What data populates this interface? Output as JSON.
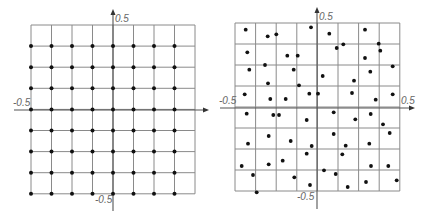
{
  "colors": {
    "grid": "#8a8a8a",
    "axis": "#555555",
    "dot": "#111111",
    "label": "#666666"
  },
  "panels": [
    {
      "name": "regular-grid-samples",
      "grid": {
        "x0": 31,
        "y0": 25,
        "cols": 8,
        "rows": 8,
        "cell_w": 20.5,
        "cell_h": 21.1
      },
      "axes": {
        "h": {
          "x1": 14,
          "x2": 209,
          "y": 110
        },
        "v": {
          "x": 113,
          "y1": 9,
          "y2": 211
        }
      },
      "labels": {
        "y_top": {
          "text": "0.5",
          "x": 115,
          "y": 22
        },
        "x_left": {
          "text": "-0.5",
          "x": 13,
          "y": 106
        },
        "y_bottom": {
          "text": "-0.5",
          "x": 95,
          "y": 203
        }
      },
      "dots_rule": {
        "cols": [
          0,
          1,
          2,
          3,
          4,
          5,
          6,
          7
        ],
        "rows": [
          1,
          2,
          3,
          4,
          5,
          6,
          7,
          8
        ]
      }
    },
    {
      "name": "jittered-random-samples",
      "grid": {
        "x0": 235,
        "y0": 23,
        "cols": 8,
        "rows": 8,
        "cell_w": 20.6,
        "cell_h": 21.0
      },
      "axes": {
        "h": {
          "x1": 220,
          "x2": 415,
          "y": 108
        },
        "v": {
          "x": 317,
          "y1": 7,
          "y2": 209
        }
      },
      "labels": {
        "y_top": {
          "text": "0.5",
          "x": 319,
          "y": 20
        },
        "x_left": {
          "text": "-0.5",
          "x": 219,
          "y": 104
        },
        "x_right": {
          "text": "0.5",
          "x": 401,
          "y": 104
        },
        "y_bottom": {
          "text": "-0.5",
          "x": 297,
          "y": 200
        }
      },
      "dots": [
        [
          245.7,
          29.7
        ],
        [
          267.7,
          36.3
        ],
        [
          276.3,
          34.3
        ],
        [
          311,
          27.3
        ],
        [
          247.3,
          52.3
        ],
        [
          287.3,
          55.7
        ],
        [
          297.7,
          55.7
        ],
        [
          265,
          65
        ],
        [
          249.3,
          69.7
        ],
        [
          293.7,
          69.7
        ],
        [
          268,
          83.3
        ],
        [
          299,
          85.3
        ],
        [
          244.7,
          94.3
        ],
        [
          270.3,
          99
        ],
        [
          285.7,
          99
        ],
        [
          309.3,
          93.7
        ],
        [
          318,
          93.7
        ],
        [
          329.3,
          33.7
        ],
        [
          365,
          29.7
        ],
        [
          336.7,
          48
        ],
        [
          343.3,
          44.3
        ],
        [
          378.7,
          43.7
        ],
        [
          380.3,
          50.7
        ],
        [
          365,
          58
        ],
        [
          392.7,
          66.3
        ],
        [
          322.7,
          76
        ],
        [
          370.3,
          71.7
        ],
        [
          354,
          80.7
        ],
        [
          352,
          93
        ],
        [
          375.7,
          99.7
        ],
        [
          392.7,
          94.3
        ],
        [
          246.7,
          113.7
        ],
        [
          273.3,
          115
        ],
        [
          279,
          115
        ],
        [
          306.7,
          120
        ],
        [
          268.7,
          136
        ],
        [
          248,
          143.7
        ],
        [
          290.7,
          141
        ],
        [
          311.7,
          146
        ],
        [
          306.7,
          153.7
        ],
        [
          282.7,
          160.7
        ],
        [
          268.7,
          164.3
        ],
        [
          241.7,
          166
        ],
        [
          253,
          175
        ],
        [
          294.3,
          177.3
        ],
        [
          310,
          185
        ],
        [
          256.7,
          192.3
        ],
        [
          333.7,
          112.3
        ],
        [
          355.3,
          119.3
        ],
        [
          370.7,
          114
        ],
        [
          383,
          124.3
        ],
        [
          333.7,
          134
        ],
        [
          389.7,
          133
        ],
        [
          345.7,
          145.7
        ],
        [
          369.3,
          143.7
        ],
        [
          342.3,
          154.3
        ],
        [
          371,
          166
        ],
        [
          388.3,
          166
        ],
        [
          324,
          170.3
        ],
        [
          335.7,
          174
        ],
        [
          366,
          182
        ],
        [
          396.7,
          180.3
        ],
        [
          347.7,
          187
        ]
      ]
    }
  ]
}
